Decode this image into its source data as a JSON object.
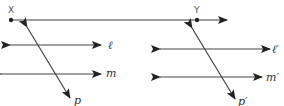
{
  "diagram": {
    "type": "geometry",
    "stroke_color": "#333333",
    "points": [
      {
        "id": "X",
        "label": "X",
        "x": 11,
        "y": 20
      },
      {
        "id": "Y",
        "label": "Y",
        "x": 197,
        "y": 20
      }
    ],
    "ray": {
      "from": "X",
      "through": "Y",
      "label": "ray XY"
    },
    "left_figure": {
      "lines": [
        {
          "id": "l",
          "label": "ℓ",
          "y": 45
        },
        {
          "id": "m",
          "label": "m",
          "y": 74
        }
      ],
      "transversal": {
        "id": "p",
        "label": "p"
      }
    },
    "right_figure": {
      "lines": [
        {
          "id": "l_prime",
          "label": "ℓ′",
          "y": 49
        },
        {
          "id": "m_prime",
          "label": "m′",
          "y": 77
        }
      ],
      "transversal": {
        "id": "p_prime",
        "label": "p′"
      }
    }
  }
}
